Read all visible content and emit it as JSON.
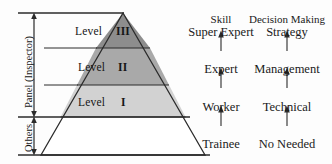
{
  "figure": {
    "type": "pyramid-hierarchy-diagram",
    "background_color": "#fdfdfd",
    "line_color": "#2b2b2b"
  },
  "pyramid": {
    "levels": [
      {
        "label": "Level",
        "numeral": "III",
        "fill": "#8d8d8d",
        "tier": 3
      },
      {
        "label": "Level",
        "numeral": "II",
        "fill": "#a9a9a9",
        "tier": 2
      },
      {
        "label": "Level",
        "numeral": "I",
        "fill": "#d2d2d2",
        "tier": 1
      },
      {
        "label": "",
        "numeral": "",
        "fill": "#ffffff",
        "tier": 0
      }
    ]
  },
  "brackets": [
    {
      "name": "panel-bracket",
      "label": "Panel (Inspector)"
    },
    {
      "name": "others-bracket",
      "label": "Others"
    }
  ],
  "columns": [
    {
      "header": "Skill",
      "cells": [
        "Super Expert",
        "Expert",
        "Worker",
        "Trainee"
      ]
    },
    {
      "header": "Decision Making",
      "cells": [
        "Strategy",
        "Management",
        "Technical",
        "No Needed"
      ]
    }
  ]
}
